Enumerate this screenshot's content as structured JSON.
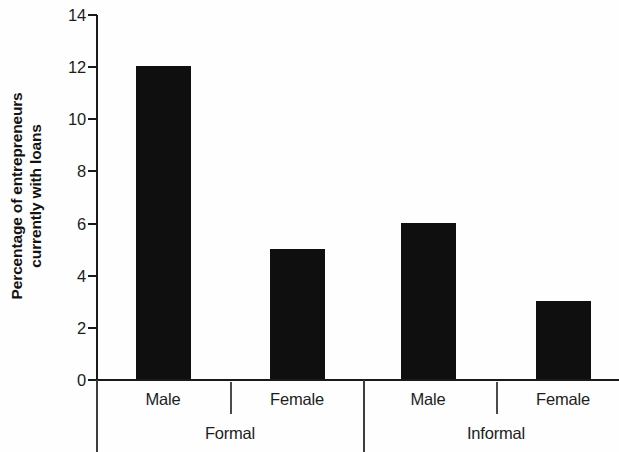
{
  "chart_data": {
    "type": "bar",
    "title": "",
    "subtitle": "",
    "xlabel": "",
    "ylabel": "Percentage of entrepreneurs currently with loans",
    "ylabel_line1": "Percentage of entrepreneurs",
    "ylabel_line2": "currently with loans",
    "ylim": [
      0,
      14
    ],
    "ytick_values": [
      14,
      12,
      10,
      8,
      6,
      4,
      2,
      0
    ],
    "ytick_labels": [
      "14",
      "12",
      "10",
      "8",
      "6",
      "4",
      "2",
      "0"
    ],
    "grid": false,
    "legend": false,
    "legend_position": "none",
    "bar_color": "#100f0f",
    "axis_color": "#1a1a1a",
    "background_color": "#fefefe",
    "categories": [
      "Male",
      "Female",
      "Male",
      "Female"
    ],
    "values": [
      12,
      5,
      6,
      3
    ],
    "groups": [
      {
        "label": "Formal",
        "categories": [
          "Male",
          "Female"
        ],
        "values": [
          12,
          5
        ]
      },
      {
        "label": "Informal",
        "categories": [
          "Male",
          "Female"
        ],
        "values": [
          6,
          3
        ]
      }
    ],
    "bars": [
      {
        "group": "Formal",
        "category": "Male",
        "value": 12
      },
      {
        "group": "Formal",
        "category": "Female",
        "value": 5
      },
      {
        "group": "Informal",
        "category": "Male",
        "value": 6
      },
      {
        "group": "Informal",
        "category": "Female",
        "value": 3
      }
    ]
  }
}
